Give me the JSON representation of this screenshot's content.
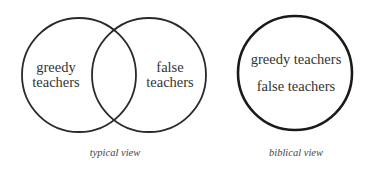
{
  "typical": {
    "left_circle_label_line1": "greedy",
    "left_circle_label_line2": "teachers",
    "right_circle_label_line1": "false",
    "right_circle_label_line2": "teachers",
    "caption": "typical view"
  },
  "biblical": {
    "label_line1": "greedy teachers",
    "label_line2": "false teachers",
    "caption": "biblical view"
  },
  "colors": {
    "stroke": "#2a2a2a",
    "text": "#333333",
    "background": "#ffffff"
  }
}
